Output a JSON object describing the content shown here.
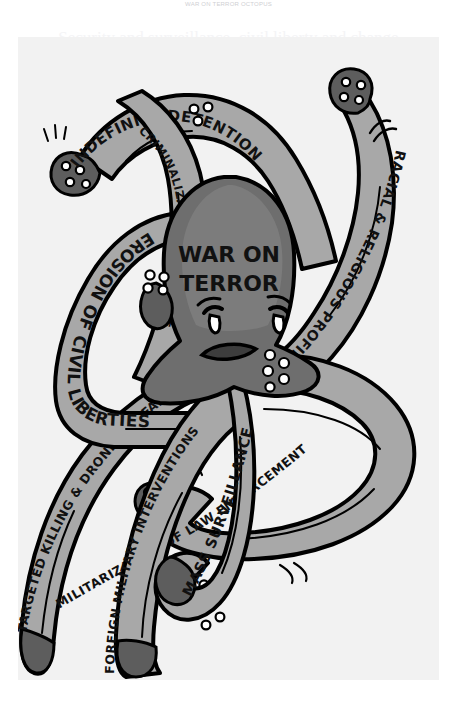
{
  "page": {
    "background_color": "#ffffff",
    "canvas_color": "#f2f2f2",
    "watermark_top": "WAR ON TERROR OCTOPUS",
    "watermark_sub": "Security and surveillance, civil liberty and change"
  },
  "palette": {
    "ink": "#000000",
    "body_gray": "#6e6e6e",
    "band_gray": "#a8a8a8",
    "highlight_gray": "#8c8c8c",
    "sucker_white": "#ffffff",
    "paper": "#f2f2f2"
  },
  "illustration": {
    "type": "hand-drawn grayscale political cartoon",
    "subject": "octopus",
    "head_label_line1": "WAR ON",
    "head_label_line2": "TERROR",
    "face": {
      "expression": "angry",
      "eye_left": "angry-eye",
      "eye_right": "angry-eye",
      "mouth": "frown"
    },
    "tentacles": [
      {
        "id": "indefinite-detention",
        "label": "INDEFINITE DETENTION",
        "position": "upper-left-arc"
      },
      {
        "id": "criminalization-dissent",
        "label": "CRIMINALIZATION OF DISSENT",
        "position": "upper-left-inner"
      },
      {
        "id": "erosion-civil-liberties",
        "label": "EROSION OF CIVIL LIBERTIES",
        "position": "left"
      },
      {
        "id": "racial-religious-profiling",
        "label": "RACIAL & RELIGIOUS PROFILING",
        "position": "upper-right-arc"
      },
      {
        "id": "militarization-law-enforcement",
        "label": "MILITARIZATION OF LAW ENFORCEMENT",
        "position": "lower-right"
      },
      {
        "id": "mass-surveillance",
        "label": "MASS SURVEILLANCE",
        "position": "bottom-center"
      },
      {
        "id": "foreign-military-interventions",
        "label": "FOREIGN MILITARY INTERVENTIONS",
        "position": "bottom-left-inner"
      },
      {
        "id": "targeted-killing-drone-warfare",
        "label": "TARGETED KILLING & DRONE WARFARE",
        "position": "lower-left"
      }
    ]
  }
}
